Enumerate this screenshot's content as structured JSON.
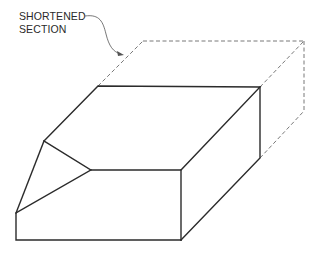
{
  "figure": {
    "type": "isometric technical drawing",
    "label": {
      "line1": "SHORTENED",
      "line2": "SECTION"
    },
    "colors": {
      "line": "#2b2b2b",
      "hidden_line": "#6a6a6a",
      "background": "#ffffff"
    }
  }
}
